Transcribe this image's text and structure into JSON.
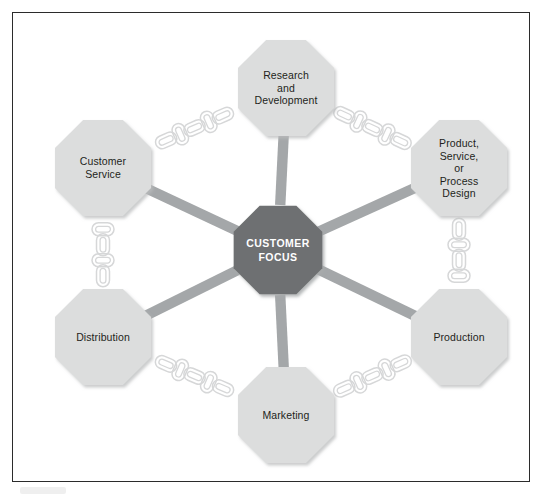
{
  "diagram": {
    "center": {
      "label": "CUSTOMER\nFOCUS",
      "fill": "#6e7072",
      "text_color": "#ffffff",
      "cx": 278,
      "cy": 250,
      "radius": 48
    },
    "colors": {
      "node_fill": "#dcdddd",
      "node_fill_alt": "#d9dadb",
      "center_fill": "#6e7072",
      "spoke": "#a4a7a9",
      "chain_stroke": "#d6d7d8",
      "frame_border": "#2b2b2b",
      "text": "#231f20",
      "background": "#ffffff"
    },
    "nodes": [
      {
        "id": "research-and-development",
        "label": "Research\nand\nDevelopment",
        "cx": 286,
        "cy": 88,
        "radius": 52,
        "font_size": 10.5
      },
      {
        "id": "product-service-or-process-design",
        "label": "Product,\nService,\nor\nProcess\nDesign",
        "cx": 459,
        "cy": 168,
        "radius": 52,
        "font_size": 10.5
      },
      {
        "id": "production",
        "label": "Production",
        "cx": 459,
        "cy": 337,
        "radius": 52,
        "font_size": 10.5
      },
      {
        "id": "marketing",
        "label": "Marketing",
        "cx": 286,
        "cy": 415,
        "radius": 52,
        "font_size": 10.5
      },
      {
        "id": "distribution",
        "label": "Distribution",
        "cx": 103,
        "cy": 337,
        "radius": 52,
        "font_size": 10.5
      },
      {
        "id": "customer-service",
        "label": "Customer\nService",
        "cx": 103,
        "cy": 168,
        "radius": 52,
        "font_size": 10.5
      }
    ],
    "spokes": [
      {
        "from": "center",
        "to": "research-and-development"
      },
      {
        "from": "center",
        "to": "product-service-or-process-design"
      },
      {
        "from": "center",
        "to": "production"
      },
      {
        "from": "center",
        "to": "marketing"
      },
      {
        "from": "center",
        "to": "distribution"
      },
      {
        "from": "center",
        "to": "customer-service"
      }
    ],
    "chains": [
      {
        "id": "chain-customer-service-to-rnd",
        "from": "customer-service",
        "to": "research-and-development",
        "links": 5
      },
      {
        "id": "chain-rnd-to-product-design",
        "from": "research-and-development",
        "to": "product-service-or-process-design",
        "links": 5
      },
      {
        "id": "chain-product-design-to-production",
        "from": "product-service-or-process-design",
        "to": "production",
        "links": 4
      },
      {
        "id": "chain-production-to-marketing",
        "from": "production",
        "to": "marketing",
        "links": 5
      },
      {
        "id": "chain-marketing-to-distribution",
        "from": "marketing",
        "to": "distribution",
        "links": 5
      },
      {
        "id": "chain-distribution-to-customer-service",
        "from": "distribution",
        "to": "customer-service",
        "links": 4
      }
    ]
  }
}
